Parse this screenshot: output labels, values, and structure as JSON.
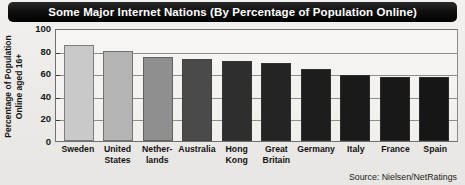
{
  "chart_data": {
    "type": "bar",
    "title": "Some Major Internet Nations (By Percentage of Population Online)",
    "xlabel": "",
    "ylabel": "Percentage of Population Online aged 16+",
    "ylim": [
      0,
      100
    ],
    "yticks": [
      100,
      80,
      60,
      40,
      20,
      0
    ],
    "grid": true,
    "legend": null,
    "source": "Source: Nielsen/NetRatings",
    "categories": [
      "Sweden",
      "United States",
      "Netherlands",
      "Australia",
      "Hong Kong",
      "Great Britain",
      "Germany",
      "Italy",
      "France",
      "Spain"
    ],
    "category_lines": [
      [
        "Sweden"
      ],
      [
        "United",
        "States"
      ],
      [
        "Nether-",
        "lands"
      ],
      [
        "Australia"
      ],
      [
        "Hong",
        "Kong"
      ],
      [
        "Great",
        "Britain"
      ],
      [
        "Germany"
      ],
      [
        "Italy"
      ],
      [
        "France"
      ],
      [
        "Spain"
      ]
    ],
    "values": [
      85,
      80,
      74,
      73,
      71,
      69,
      64,
      58,
      57,
      57
    ],
    "bar_colors": [
      "#c9c9c9",
      "#b4b4b4",
      "#8f8f8f",
      "#4a4a4a",
      "#2e2e2e",
      "#242424",
      "#1d1d1d",
      "#1a1a1a",
      "#181818",
      "#161616"
    ]
  },
  "ytitle": {
    "line1": "Percentage of Population",
    "line2": "Online aged 16+"
  }
}
